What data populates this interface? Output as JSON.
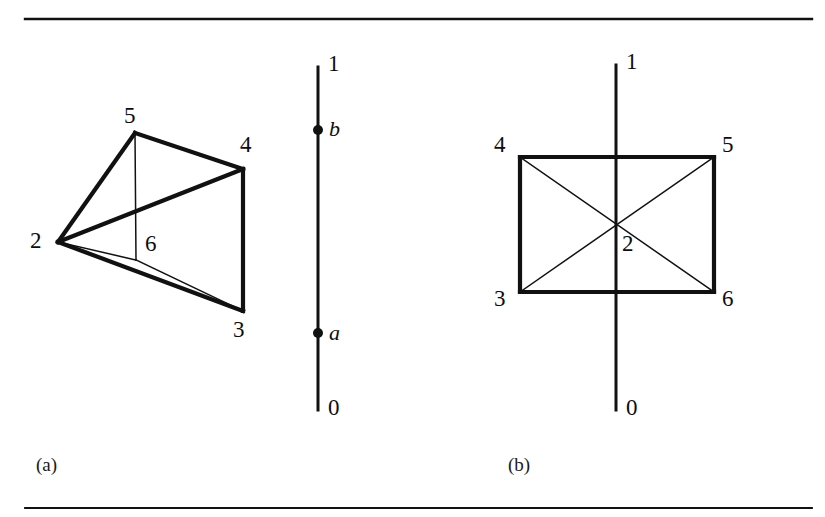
{
  "figure": {
    "rules": {
      "top": {
        "x1": 25,
        "y1": 19,
        "x2": 812,
        "y2": 19,
        "width": 2.4
      },
      "bottom": {
        "x1": 25,
        "y1": 508,
        "x2": 812,
        "y2": 508,
        "width": 1.8
      }
    },
    "captions": [
      {
        "id": "a",
        "text": "(a)"
      },
      {
        "id": "b",
        "text": "(b)"
      }
    ]
  },
  "panel_a": {
    "name": "tetrahedral-graph-panel",
    "nodes": [
      {
        "id": "5",
        "label": "5",
        "x": 135,
        "y": 133,
        "label_x": 124,
        "label_y": 104
      },
      {
        "id": "4",
        "label": "4",
        "x": 243,
        "y": 169,
        "label_x": 240,
        "label_y": 133
      },
      {
        "id": "2",
        "label": "2",
        "x": 58,
        "y": 242,
        "label_x": 30,
        "label_y": 229
      },
      {
        "id": "6",
        "label": "6",
        "x": 136,
        "y": 260,
        "label_x": 145,
        "label_y": 232
      },
      {
        "id": "3",
        "label": "3",
        "x": 243,
        "y": 311,
        "label_x": 233,
        "label_y": 318
      }
    ],
    "edges": [
      {
        "from": "2",
        "to": "5",
        "weight": "thick"
      },
      {
        "from": "5",
        "to": "4",
        "weight": "thick"
      },
      {
        "from": "2",
        "to": "4",
        "weight": "thick"
      },
      {
        "from": "4",
        "to": "3",
        "weight": "thick"
      },
      {
        "from": "2",
        "to": "3",
        "weight": "thick"
      },
      {
        "from": "5",
        "to": "6",
        "weight": "thin"
      },
      {
        "from": "2",
        "to": "6",
        "weight": "thin"
      },
      {
        "from": "6",
        "to": "3",
        "weight": "thin"
      }
    ]
  },
  "axis_a": {
    "name": "interval-axis-a",
    "line": {
      "x": 318,
      "y_top": 67,
      "y_bottom": 410,
      "width": 3
    },
    "top_label": {
      "text": "1",
      "x": 328,
      "y": 52
    },
    "bottom_label": {
      "text": "0",
      "x": 328,
      "y": 396
    },
    "points": [
      {
        "id": "b",
        "label": "b",
        "x": 318,
        "y": 130,
        "r": 5,
        "label_x": 329,
        "label_y": 118
      },
      {
        "id": "a",
        "label": "a",
        "x": 318,
        "y": 333,
        "r": 5,
        "label_x": 329,
        "label_y": 322
      }
    ]
  },
  "panel_b": {
    "name": "rectangle-graph-panel",
    "axis": {
      "x": 616,
      "y_top": 65,
      "y_bottom": 410,
      "width": 3,
      "top_label": {
        "text": "1",
        "x": 626,
        "y": 50
      },
      "bottom_label": {
        "text": "0",
        "x": 626,
        "y": 396
      }
    },
    "nodes": [
      {
        "id": "4",
        "label": "4",
        "x": 520,
        "y": 157,
        "label_x": 494,
        "label_y": 133
      },
      {
        "id": "5",
        "label": "5",
        "x": 714,
        "y": 157,
        "label_x": 722,
        "label_y": 133
      },
      {
        "id": "3",
        "label": "3",
        "x": 520,
        "y": 292,
        "label_x": 494,
        "label_y": 287
      },
      {
        "id": "6",
        "label": "6",
        "x": 714,
        "y": 292,
        "label_x": 722,
        "label_y": 287
      },
      {
        "id": "2",
        "label": "2",
        "x": 616,
        "y": 224,
        "label_x": 622,
        "label_y": 232
      }
    ],
    "edges": [
      {
        "from": "4",
        "to": "5",
        "weight": "thick"
      },
      {
        "from": "3",
        "to": "6",
        "weight": "thick"
      },
      {
        "from": "4",
        "to": "3",
        "weight": "thick"
      },
      {
        "from": "5",
        "to": "6",
        "weight": "thick"
      },
      {
        "from": "4",
        "to": "6",
        "weight": "thin"
      },
      {
        "from": "3",
        "to": "5",
        "weight": "thin"
      }
    ]
  },
  "style": {
    "ink": "#111111",
    "paper": "#ffffff",
    "thick_width": 4.2,
    "thin_width": 1.5
  }
}
